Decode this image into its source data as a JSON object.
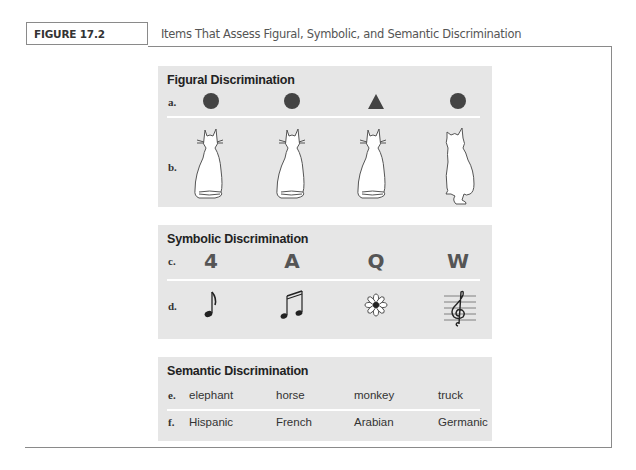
{
  "figure": {
    "tab_label": "FIGURE 17.2",
    "caption": "Items That Assess Figural, Symbolic, and Semantic Discrimination"
  },
  "colors": {
    "panel_bg": "#e6e6e6",
    "shape_fill": "#444444",
    "frame_border": "#8a8a8a",
    "separator": "#ffffff"
  },
  "panels": [
    {
      "title": "Figural Discrimination",
      "rows": [
        {
          "label": "a.",
          "items": [
            "circle-icon",
            "circle-icon",
            "triangle-icon",
            "circle-icon"
          ]
        },
        {
          "label": "b.",
          "items": [
            "cat-sitting-back-icon",
            "cat-sitting-back-icon",
            "cat-sitting-back-icon",
            "cat-sitting-side-icon"
          ]
        }
      ]
    },
    {
      "title": "Symbolic Discrimination",
      "rows": [
        {
          "label": "c.",
          "items": [
            "4",
            "A",
            "Q",
            "W"
          ]
        },
        {
          "label": "d.",
          "items": [
            "eighth-note-icon",
            "beamed-sixteenth-notes-icon",
            "flower-icon",
            "treble-clef-staff-icon"
          ]
        }
      ]
    },
    {
      "title": "Semantic Discrimination",
      "rows": [
        {
          "label": "e.",
          "items": [
            "elephant",
            "horse",
            "monkey",
            "truck"
          ]
        },
        {
          "label": "f.",
          "items": [
            "Hispanic",
            "French",
            "Arabian",
            "Germanic"
          ]
        }
      ]
    }
  ]
}
